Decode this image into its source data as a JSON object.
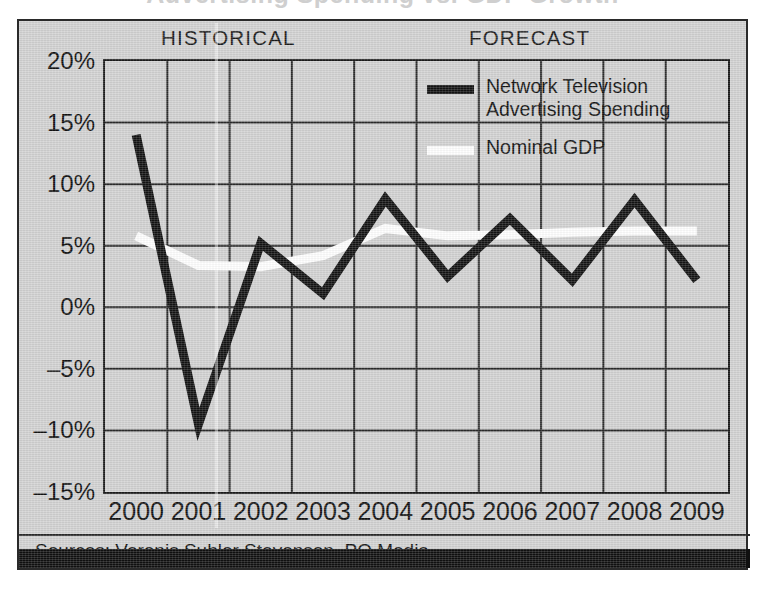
{
  "panel": {
    "background_color": "#d3d3d3",
    "border_color": "#2a2a2a"
  },
  "sections": {
    "historical_label": "HISTORICAL",
    "forecast_label": "FORECAST"
  },
  "legend": {
    "entries": [
      {
        "label": "Network Television\nAdvertising Spending",
        "color": "#131313",
        "swatch": "black-line-swatch"
      },
      {
        "label": "Nominal GDP",
        "color": "#ffffff",
        "swatch": "white-line-swatch"
      }
    ]
  },
  "source": {
    "text": "Sources: Veronis Suhler Stevenson, PQ Media"
  },
  "chart_data": {
    "type": "line",
    "title": "",
    "xlabel": "",
    "ylabel": "",
    "x": [
      "2000",
      "2001",
      "2002",
      "2003",
      "2004",
      "2005",
      "2006",
      "2007",
      "2008",
      "2009"
    ],
    "xtick_labels": [
      "2000",
      "2001",
      "2002",
      "2003",
      "2004",
      "2005",
      "2006",
      "2007",
      "2008",
      "2009"
    ],
    "ytick_labels": [
      "20%",
      "15%",
      "10%",
      "5%",
      "0%",
      "-5%",
      "-10%",
      "-15%"
    ],
    "ytick_values": [
      20,
      15,
      10,
      5,
      0,
      -5,
      -10,
      -15
    ],
    "ylim": [
      -15,
      20
    ],
    "grid": true,
    "legend_position": "upper-right-inside",
    "annotations": [
      {
        "text": "HISTORICAL",
        "region": "2000-2004"
      },
      {
        "text": "FORECAST",
        "region": "2005-2009"
      }
    ],
    "series": [
      {
        "name": "Network Television Advertising Spending",
        "color": "#131313",
        "values": [
          14.0,
          -9.5,
          5.2,
          1.1,
          8.8,
          2.5,
          7.2,
          2.2,
          8.7,
          2.2
        ]
      },
      {
        "name": "Nominal GDP",
        "color": "#ffffff",
        "values": [
          5.8,
          3.4,
          3.3,
          4.2,
          6.4,
          5.8,
          5.9,
          6.1,
          6.2,
          6.2
        ]
      }
    ]
  }
}
